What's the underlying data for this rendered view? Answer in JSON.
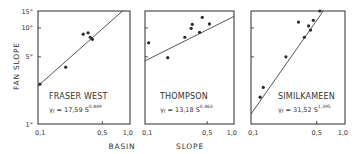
{
  "figure": {
    "y_axis_label": "FAN SLOPE",
    "x_axis_label_parts": [
      "BASIN",
      "SLOPE"
    ],
    "y_ticks": [
      {
        "value": 1,
        "label": "1°"
      },
      {
        "value": 5,
        "label": "5°"
      },
      {
        "value": 10,
        "label": "10°"
      },
      {
        "value": 15,
        "label": "15°"
      }
    ],
    "x_ticks": [
      {
        "value": 0.1,
        "label": "0,1"
      },
      {
        "value": 0.5,
        "label": "0,5"
      },
      {
        "value": 1.0,
        "label": "1,0"
      }
    ],
    "colors": {
      "ink": "#2a2a2a",
      "background": "#ffffff"
    }
  },
  "chart_data": [
    {
      "type": "scatter",
      "title": "FRASER WEST",
      "equation": {
        "lhs": "Yf",
        "coef": "17,59",
        "base": "S",
        "exponent": "0,849"
      },
      "xlabel": "BASIN SLOPE",
      "ylabel": "FAN SLOPE",
      "xscale": "log",
      "yscale": "log",
      "xlim": [
        0.1,
        1.0
      ],
      "ylim": [
        1,
        15
      ],
      "points": [
        {
          "x": 0.105,
          "y": 2.6
        },
        {
          "x": 0.2,
          "y": 3.9
        },
        {
          "x": 0.31,
          "y": 8.6
        },
        {
          "x": 0.35,
          "y": 8.9
        },
        {
          "x": 0.37,
          "y": 8.0
        },
        {
          "x": 0.39,
          "y": 7.6
        }
      ],
      "fit": {
        "coef": 17.59,
        "exponent": 0.849
      }
    },
    {
      "type": "scatter",
      "title": "THOMPSON",
      "equation": {
        "lhs": "Yf",
        "coef": "13,18",
        "base": "S",
        "exponent": "0,463"
      },
      "xlabel": "BASIN SLOPE",
      "ylabel": "FAN SLOPE",
      "xscale": "log",
      "yscale": "log",
      "xlim": [
        0.1,
        1.0
      ],
      "ylim": [
        1,
        15
      ],
      "points": [
        {
          "x": 0.11,
          "y": 7.0
        },
        {
          "x": 0.18,
          "y": 4.9
        },
        {
          "x": 0.28,
          "y": 8.0
        },
        {
          "x": 0.33,
          "y": 9.9
        },
        {
          "x": 0.34,
          "y": 10.9
        },
        {
          "x": 0.41,
          "y": 9.0
        },
        {
          "x": 0.44,
          "y": 12.9
        },
        {
          "x": 0.53,
          "y": 11.0
        }
      ],
      "fit": {
        "coef": 13.18,
        "exponent": 0.463
      }
    },
    {
      "type": "scatter",
      "title": "SIMILKAMEEN",
      "equation": {
        "lhs": "Yf",
        "coef": "31,52",
        "base": "S",
        "exponent": "1,395"
      },
      "xlabel": "BASIN SLOPE",
      "ylabel": "FAN SLOPE",
      "xscale": "log",
      "yscale": "log",
      "xlim": [
        0.1,
        1.0
      ],
      "ylim": [
        1,
        15
      ],
      "points": [
        {
          "x": 0.125,
          "y": 1.9
        },
        {
          "x": 0.135,
          "y": 2.4
        },
        {
          "x": 0.235,
          "y": 5.0
        },
        {
          "x": 0.32,
          "y": 11.5
        },
        {
          "x": 0.37,
          "y": 8.0
        },
        {
          "x": 0.41,
          "y": 10.5
        },
        {
          "x": 0.43,
          "y": 9.5
        },
        {
          "x": 0.46,
          "y": 12.0
        },
        {
          "x": 0.54,
          "y": 15.0
        }
      ],
      "fit": {
        "coef": 31.52,
        "exponent": 1.395
      }
    }
  ]
}
